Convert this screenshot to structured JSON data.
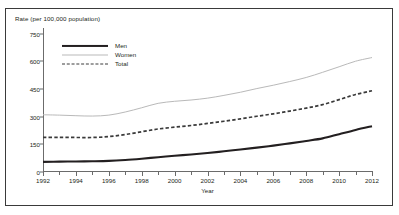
{
  "figure": {
    "cut_title": "",
    "frame_color": "#3a3a3a",
    "background": "#ffffff"
  },
  "legend": {
    "position": "inside-top-left",
    "entries": [
      {
        "label": "Men",
        "style": "solid-thick",
        "color": "#231f20"
      },
      {
        "label": "Women",
        "style": "solid-thin",
        "color": "#b9b9b9"
      },
      {
        "label": "Total",
        "style": "dashed",
        "color": "#3a3a3a"
      }
    ]
  },
  "chart_data": {
    "type": "line",
    "title": "",
    "xlabel": "Year",
    "ylabel": "Rate (per 100,000 population)",
    "xlim": [
      1992,
      2012
    ],
    "ylim": [
      0,
      780
    ],
    "yticks": [
      0,
      150,
      300,
      450,
      600,
      750
    ],
    "ytick_labels": [
      "0",
      "150",
      "300",
      "450",
      "600",
      "750"
    ],
    "xticks": [
      1992,
      1993,
      1994,
      1995,
      1996,
      1997,
      1998,
      1999,
      2000,
      2001,
      2002,
      2003,
      2004,
      2005,
      2006,
      2007,
      2008,
      2009,
      2010,
      2011,
      2012
    ],
    "xtick_labels_major": [
      "1992",
      "1994",
      "1996",
      "1998",
      "2000",
      "2002",
      "2004",
      "2006",
      "2008",
      "2010",
      "2012"
    ],
    "grid": false,
    "x": [
      1992,
      1993,
      1994,
      1995,
      1996,
      1997,
      1998,
      1999,
      2000,
      2001,
      2002,
      2003,
      2004,
      2005,
      2006,
      2007,
      2008,
      2009,
      2010,
      2011,
      2012
    ],
    "series": [
      {
        "name": "Men",
        "color": "#231f20",
        "style": "solid-thick",
        "values": [
          55,
          56,
          57,
          58,
          60,
          65,
          72,
          80,
          88,
          95,
          103,
          112,
          122,
          132,
          143,
          155,
          168,
          182,
          205,
          228,
          248
        ]
      },
      {
        "name": "Women",
        "color": "#b9b9b9",
        "style": "solid-thin",
        "values": [
          310,
          308,
          305,
          303,
          308,
          325,
          348,
          372,
          383,
          390,
          400,
          415,
          432,
          452,
          470,
          490,
          512,
          540,
          570,
          600,
          620
        ]
      },
      {
        "name": "Total",
        "color": "#3a3a3a",
        "style": "dashed",
        "values": [
          188,
          188,
          187,
          187,
          192,
          203,
          218,
          233,
          243,
          252,
          263,
          275,
          288,
          302,
          315,
          330,
          346,
          365,
          392,
          420,
          440
        ]
      }
    ]
  }
}
